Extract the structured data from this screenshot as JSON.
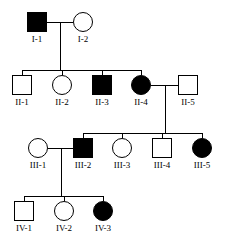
{
  "figure": {
    "type": "pedigree-chart",
    "width": 227,
    "height": 250,
    "background_color": "#ffffff",
    "line_color": "#000000",
    "affected_fill_color": "#000000",
    "unaffected_fill_color": "#ffffff",
    "symbol_size": 20,
    "legend_note": "filled = affected, open = unaffected; square = male, circle = female"
  },
  "generations": [
    {
      "roman": "I",
      "individuals": [
        {
          "id": "I-1",
          "label": "I-1",
          "sex": "male",
          "shape": "square",
          "affected": true,
          "x": 27,
          "y": 12
        },
        {
          "id": "I-2",
          "label": "I-2",
          "sex": "female",
          "shape": "circle",
          "affected": false,
          "x": 73,
          "y": 12
        }
      ]
    },
    {
      "roman": "II",
      "individuals": [
        {
          "id": "II-1",
          "label": "II-1",
          "sex": "male",
          "shape": "square",
          "affected": false,
          "x": 12,
          "y": 75
        },
        {
          "id": "II-2",
          "label": "II-2",
          "sex": "female",
          "shape": "circle",
          "affected": false,
          "x": 52,
          "y": 75
        },
        {
          "id": "II-3",
          "label": "II-3",
          "sex": "male",
          "shape": "square",
          "affected": true,
          "x": 92,
          "y": 75
        },
        {
          "id": "II-4",
          "label": "II-4",
          "sex": "female",
          "shape": "circle",
          "affected": true,
          "x": 131,
          "y": 75
        },
        {
          "id": "II-5",
          "label": "II-5",
          "sex": "male",
          "shape": "square",
          "affected": false,
          "x": 178,
          "y": 75
        }
      ]
    },
    {
      "roman": "III",
      "individuals": [
        {
          "id": "III-1",
          "label": "III-1",
          "sex": "female",
          "shape": "circle",
          "affected": false,
          "x": 28,
          "y": 138
        },
        {
          "id": "III-2",
          "label": "III-2",
          "sex": "male",
          "shape": "square",
          "affected": true,
          "x": 73,
          "y": 138
        },
        {
          "id": "III-3",
          "label": "III-3",
          "sex": "female",
          "shape": "circle",
          "affected": false,
          "x": 112,
          "y": 138
        },
        {
          "id": "III-4",
          "label": "III-4",
          "sex": "male",
          "shape": "square",
          "affected": false,
          "x": 152,
          "y": 138
        },
        {
          "id": "III-5",
          "label": "III-5",
          "sex": "female",
          "shape": "circle",
          "affected": true,
          "x": 192,
          "y": 138
        }
      ]
    },
    {
      "roman": "IV",
      "individuals": [
        {
          "id": "IV-1",
          "label": "IV-1",
          "sex": "male",
          "shape": "square",
          "affected": false,
          "x": 14,
          "y": 201
        },
        {
          "id": "IV-2",
          "label": "IV-2",
          "sex": "female",
          "shape": "circle",
          "affected": false,
          "x": 54,
          "y": 201
        },
        {
          "id": "IV-3",
          "label": "IV-3",
          "sex": "female",
          "shape": "circle",
          "affected": true,
          "x": 93,
          "y": 201
        }
      ]
    }
  ],
  "matings": [
    {
      "id": "mating-I1-I2",
      "partners": [
        "I-1",
        "I-2"
      ],
      "children": [
        "II-1",
        "II-2",
        "II-3",
        "II-4"
      ]
    },
    {
      "id": "mating-II4-II5",
      "partners": [
        "II-4",
        "II-5"
      ],
      "children": [
        "III-2",
        "III-3",
        "III-4",
        "III-5"
      ]
    },
    {
      "id": "mating-III1-III2",
      "partners": [
        "III-1",
        "III-2"
      ],
      "children": [
        "IV-1",
        "IV-2",
        "IV-3"
      ]
    }
  ]
}
